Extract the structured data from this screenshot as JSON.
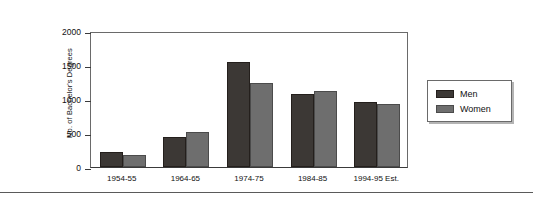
{
  "chart_data": {
    "type": "bar",
    "title": "",
    "xlabel": "",
    "ylabel": "No. of Bachelor's Degrees",
    "ylim": [
      0,
      2000
    ],
    "yticks": [
      0,
      500,
      1000,
      1500,
      2000
    ],
    "ytick_labels": [
      "0",
      "500",
      "1000",
      "1500",
      "2000"
    ],
    "grid": false,
    "legend_position": "right",
    "categories": [
      "1954-55",
      "1964-65",
      "1974-75",
      "1984-85",
      "1994-95 Est."
    ],
    "series": [
      {
        "name": "Men",
        "color": "#3c3835",
        "values": [
          220,
          440,
          1550,
          1080,
          950
        ]
      },
      {
        "name": "Women",
        "color": "#6e6e6e",
        "values": [
          180,
          510,
          1230,
          1120,
          930
        ]
      }
    ]
  },
  "legend": {
    "entries": [
      {
        "label": "Men"
      },
      {
        "label": "Women"
      }
    ]
  },
  "colors": {
    "men": "#3c3835",
    "women": "#6e6e6e",
    "frame": "#888888",
    "axis": "#3a3a3a",
    "text": "#111111"
  }
}
